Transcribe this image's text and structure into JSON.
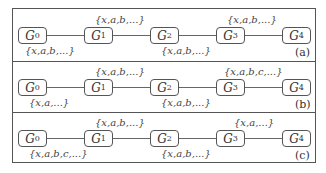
{
  "nodes": [
    "G",
    "G",
    "G",
    "G",
    "G"
  ],
  "node_subscripts": [
    "0",
    "1",
    "2",
    "3",
    "4"
  ],
  "panels": [
    {
      "tag": "(a)",
      "labels": {
        "g0_g1_below": "{x,a,b,...}",
        "g1_g2_above": "{x,a,b,...}",
        "g2_g3_below": "{x,a,b,...}",
        "g3_g4_above": "{x,a,b,...}"
      }
    },
    {
      "tag": "(b)",
      "labels": {
        "g0_g1_below": "{x,a,...}",
        "g1_g2_above": "{x,a,b,...}",
        "g2_g3_below": "{x,a,b,...}",
        "g3_g4_above": "{x,a,b,c,...}"
      }
    },
    {
      "tag": "(c)",
      "labels": {
        "g0_g1_below": "{x,a,b,c,...}",
        "g1_g2_above": "{x,a,b,...}",
        "g2_g3_below": "{x,a,b,...}",
        "g3_g4_above": "{x,a,...}"
      }
    }
  ]
}
